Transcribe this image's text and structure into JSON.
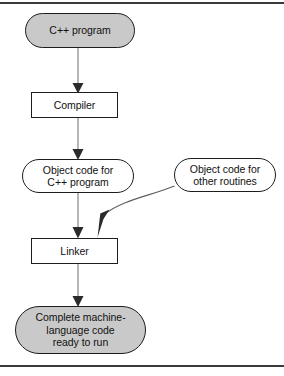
{
  "figure": {
    "width": 284,
    "height": 376,
    "shaded_fill": "#c9c9c9",
    "plain_fill": "#ffffff",
    "stroke": "#1d1d1d",
    "rule_color": "#3a3a3a"
  },
  "nodes": {
    "source": {
      "label": "C++ program",
      "shape": "stadium",
      "fill": "shaded",
      "x": 25,
      "y": 13,
      "width": 110,
      "height": 35
    },
    "compiler": {
      "label": "Compiler",
      "shape": "rect",
      "fill": "plain",
      "x": 31,
      "y": 92,
      "width": 87,
      "height": 26
    },
    "object_code_cpp": {
      "label": "Object code for\nC++ program",
      "shape": "stadium",
      "fill": "plain",
      "x": 22,
      "y": 159,
      "width": 112,
      "height": 34
    },
    "object_code_other": {
      "label": "Object code for\nother routines",
      "shape": "stadium",
      "fill": "plain",
      "x": 174,
      "y": 158,
      "width": 102,
      "height": 34
    },
    "linker": {
      "label": "Linker",
      "shape": "rect",
      "fill": "plain",
      "x": 31,
      "y": 238,
      "width": 87,
      "height": 26
    },
    "machine_code": {
      "label": "Complete machine-\nlanguage code\nready to run",
      "shape": "stadium",
      "fill": "shaded",
      "x": 15,
      "y": 306,
      "width": 131,
      "height": 48
    }
  },
  "connectors": [
    {
      "name": "source-to-compiler",
      "from": "source",
      "to": "compiler",
      "style": "straight-vertical-arrow"
    },
    {
      "name": "compiler-to-object-code-cpp",
      "from": "compiler",
      "to": "object_code_cpp",
      "style": "straight-vertical-arrow"
    },
    {
      "name": "object-code-cpp-to-linker",
      "from": "object_code_cpp",
      "to": "linker",
      "style": "straight-vertical-arrow"
    },
    {
      "name": "object-code-other-to-linker",
      "from": "object_code_other",
      "to": "linker",
      "style": "curved-arrow"
    },
    {
      "name": "linker-to-machine-code",
      "from": "linker",
      "to": "machine_code",
      "style": "straight-vertical-arrow"
    }
  ]
}
